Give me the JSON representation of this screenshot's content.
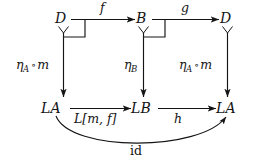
{
  "figure": {
    "kind": "commutative-diagram",
    "background_color": "#ffffff",
    "ink_color": "#141414"
  },
  "nodes": {
    "top_left": "D",
    "top_middle": "B",
    "top_right": "D",
    "bottom_left": "LA",
    "bottom_middle": "LB",
    "bottom_right": "LA"
  },
  "arrows": {
    "top_left_to_top_middle": {
      "label": "f"
    },
    "top_middle_to_top_right": {
      "label": "g"
    },
    "left_vertical": {
      "label_eta": "η",
      "label_sub": "A",
      "label_circ": "∘",
      "label_m": "m"
    },
    "middle_vertical": {
      "label_eta": "η",
      "label_sub": "B"
    },
    "right_vertical": {
      "label_eta": "η",
      "label_sub": "A",
      "label_circ": "∘",
      "label_m": "m"
    },
    "bottom_left_to_bottom_middle": {
      "label": "L[m, f]"
    },
    "bottom_middle_to_bottom_right": {
      "label": "h"
    },
    "curved_identity": {
      "label": "id"
    }
  },
  "markers": {
    "pullback_corner_left": "pullback-corner",
    "pullback_corner_middle": "pullback-corner"
  }
}
